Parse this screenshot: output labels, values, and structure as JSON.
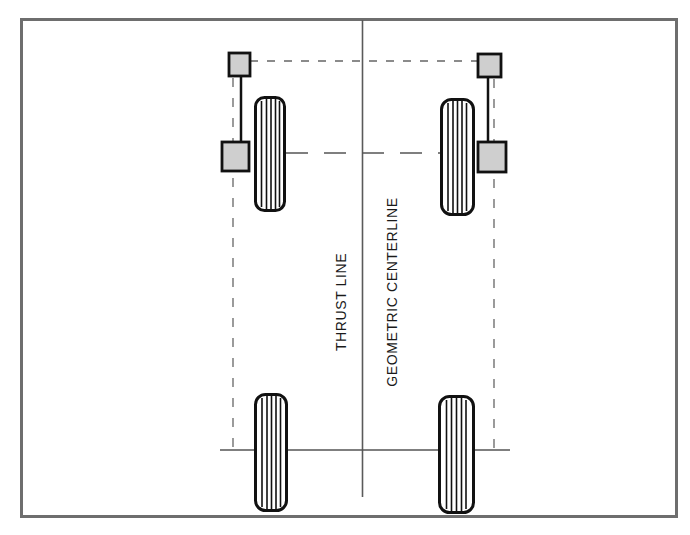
{
  "diagram": {
    "type": "vehicle-alignment-top-view",
    "labels": {
      "thrust_line": "THRUST LINE",
      "geometric_centerline": "GEOMETRIC CENTERLINE"
    },
    "components": {
      "front_left_tire": "tire",
      "front_right_tire": "tire",
      "rear_left_tire": "tire",
      "rear_right_tire": "tire",
      "front_left_targets": [
        "square-target-upper",
        "square-target-lower"
      ],
      "front_right_targets": [
        "square-target-upper",
        "square-target-lower"
      ]
    },
    "colors": {
      "frame": "#6e6e6e",
      "line": "#555555",
      "tire_outline": "#111111",
      "target_fill": "#cfcfcf",
      "target_stroke": "#111111",
      "background": "#ffffff"
    }
  }
}
